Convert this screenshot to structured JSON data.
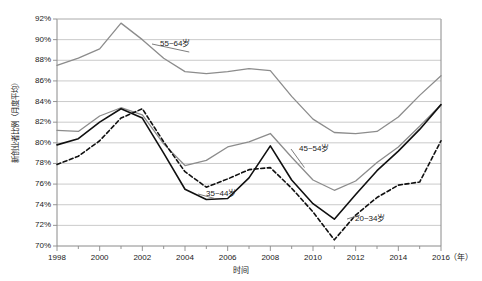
{
  "chart_data": {
    "type": "line",
    "title": "",
    "xlabel": "时间",
    "ylabel": "新创业者比例（月度平均）",
    "x_unit": "（年）",
    "x": [
      1998,
      1999,
      2000,
      2001,
      2002,
      2003,
      2004,
      2005,
      2006,
      2007,
      2008,
      2009,
      2010,
      2011,
      2012,
      2013,
      2014,
      2015,
      2016
    ],
    "xlim": [
      1998,
      2016
    ],
    "ylim": [
      70,
      92
    ],
    "y_ticks": [
      "70%",
      "72%",
      "74%",
      "76%",
      "78%",
      "80%",
      "82%",
      "84%",
      "86%",
      "88%",
      "90%",
      "92%"
    ],
    "x_ticks": [
      "1998",
      "2000",
      "2002",
      "2004",
      "2006",
      "2008",
      "2010",
      "2012",
      "2014",
      "2016"
    ],
    "x_tick_values": [
      1998,
      2000,
      2002,
      2004,
      2006,
      2008,
      2010,
      2012,
      2014,
      2016
    ],
    "y_tick_values": [
      70,
      72,
      74,
      76,
      78,
      80,
      82,
      84,
      86,
      88,
      90,
      92
    ],
    "grid": true,
    "legend_position": "inline-annotations",
    "series": [
      {
        "name": "55~64岁",
        "style": "solid",
        "color": "#8c8c8c",
        "width": 1.3,
        "values": [
          87.5,
          88.2,
          89.1,
          91.6,
          90.0,
          88.2,
          86.9,
          86.7,
          86.9,
          87.2,
          87.0,
          84.5,
          82.3,
          81.0,
          80.9,
          81.1,
          82.5,
          84.6,
          86.5
        ]
      },
      {
        "name": "45~54岁",
        "style": "solid",
        "color": "#8c8c8c",
        "width": 1.3,
        "values": [
          81.2,
          81.1,
          82.6,
          83.4,
          82.7,
          79.9,
          77.8,
          78.3,
          79.6,
          80.1,
          80.9,
          78.6,
          76.4,
          75.4,
          76.3,
          78.1,
          79.6,
          81.6,
          83.7
        ]
      },
      {
        "name": "35~44岁",
        "style": "solid",
        "color": "#101010",
        "width": 1.6,
        "values": [
          79.8,
          80.4,
          82.0,
          83.3,
          82.4,
          79.0,
          75.5,
          74.5,
          74.6,
          76.6,
          79.7,
          76.4,
          74.1,
          72.6,
          75.0,
          77.3,
          79.2,
          81.3,
          83.7
        ]
      },
      {
        "name": "20~34岁",
        "style": "dashed",
        "color": "#101010",
        "width": 1.6,
        "values": [
          77.9,
          78.7,
          80.2,
          82.4,
          83.3,
          80.1,
          77.2,
          75.7,
          76.5,
          77.4,
          77.6,
          75.6,
          73.3,
          70.6,
          73.0,
          74.7,
          75.9,
          76.2,
          80.2
        ]
      }
    ],
    "annotations": [
      {
        "text": "55~64岁",
        "series": "55~64岁",
        "anchor_x": 2004.2,
        "anchor_y": 88.8,
        "label_x": 160,
        "label_y": 40
      },
      {
        "text": "45~54岁",
        "series": "45~54岁",
        "anchor_x": 2009.6,
        "anchor_y": 77.6,
        "label_x": 299,
        "label_y": 145
      },
      {
        "text": "35~44岁",
        "series": "35~44岁",
        "anchor_x": 2005.4,
        "anchor_y": 74.6,
        "label_x": 206,
        "label_y": 190
      },
      {
        "text": "20~34岁",
        "series": "20~34岁",
        "anchor_x": 2012.2,
        "anchor_y": 73.0,
        "label_x": 355,
        "label_y": 215
      }
    ]
  }
}
